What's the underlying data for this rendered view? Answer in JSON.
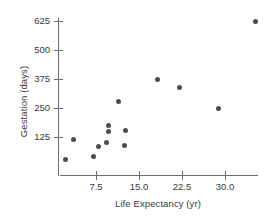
{
  "chart_data": {
    "type": "scatter",
    "title": "",
    "xlabel": "Life Expectancy (yr)",
    "ylabel": "Gestation (days)",
    "xlim": [
      0.8,
      35.8
    ],
    "ylim": [
      0,
      660
    ],
    "grid": false,
    "legend": null,
    "xticks": [
      "7.5",
      "15.0",
      "22.5",
      "30.0"
    ],
    "xtick_values": [
      7.5,
      15.0,
      22.5,
      30.0
    ],
    "yticks": [
      "125",
      "250",
      "375",
      "500",
      "625"
    ],
    "ytick_values": [
      125,
      250,
      375,
      500,
      625
    ],
    "series": [
      {
        "name": "Mammals",
        "marker": "circle",
        "color": "#4d4d4d",
        "points": [
          {
            "x": 2.1,
            "y": 30
          },
          {
            "x": 3.5,
            "y": 115
          },
          {
            "x": 7.0,
            "y": 40
          },
          {
            "x": 8.0,
            "y": 85
          },
          {
            "x": 9.4,
            "y": 100
          },
          {
            "x": 9.7,
            "y": 150
          },
          {
            "x": 9.7,
            "y": 175
          },
          {
            "x": 11.5,
            "y": 278
          },
          {
            "x": 12.5,
            "y": 90
          },
          {
            "x": 12.6,
            "y": 153
          },
          {
            "x": 18.3,
            "y": 375
          },
          {
            "x": 22.0,
            "y": 340
          },
          {
            "x": 28.8,
            "y": 248
          },
          {
            "x": 35.3,
            "y": 625
          }
        ]
      }
    ]
  },
  "axes": {
    "y_title": "Gestation (days)",
    "x_title": "Life Expectancy (yr)"
  },
  "colors": {
    "marker": "#4d4d4d",
    "axis": "#6e6e6e",
    "text": "#3a3a3a",
    "background": "#ffffff"
  }
}
